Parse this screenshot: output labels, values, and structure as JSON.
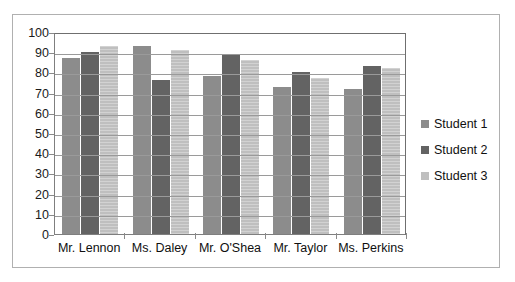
{
  "chart_data": {
    "type": "bar",
    "title": "",
    "xlabel": "",
    "ylabel": "",
    "ylim": [
      0,
      100
    ],
    "ytick_step": 10,
    "yticks": [
      0,
      10,
      20,
      30,
      40,
      50,
      60,
      70,
      80,
      90,
      100
    ],
    "grid": true,
    "legend_position": "right",
    "categories": [
      "Mr. Lennon",
      "Ms. Daley",
      "Mr. O'Shea",
      "Mr. Taylor",
      "Ms. Perkins"
    ],
    "series": [
      {
        "name": "Student 1",
        "color": "#8c8c8c",
        "values": [
          87,
          93,
          78,
          73,
          72
        ]
      },
      {
        "name": "Student 2",
        "color": "#636363",
        "values": [
          90,
          76,
          89,
          80,
          83
        ]
      },
      {
        "name": "Student 3",
        "color": "#bfbfbf",
        "values": [
          93,
          91,
          86,
          77,
          82
        ]
      }
    ]
  },
  "colors": {
    "student1": "#8c8c8c",
    "student2": "#636363",
    "student3": "#bfbfbf",
    "gridline": "#9a9a9a",
    "axis": "#7f7f7f",
    "frame_border": "#b0b0b0",
    "background": "#ffffff",
    "text": "#101010"
  }
}
